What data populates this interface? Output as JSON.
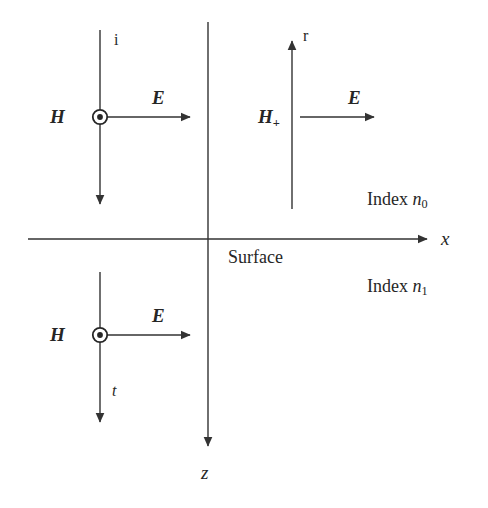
{
  "figure": {
    "name": "reflection-transmission-at-surface-diagram",
    "stroke_color": "#333333",
    "text_color": "#262626",
    "background": "#ffffff"
  },
  "axes": {
    "x_axis": {
      "label": "x",
      "direction": "right",
      "y": 239,
      "x_start": 28,
      "x_end": 433
    },
    "z_axis": {
      "label": "z",
      "direction": "down",
      "x": 208,
      "y_start": 22,
      "y_end": 452
    },
    "origin_label": "Surface"
  },
  "media": {
    "upper": {
      "prefix": "Index ",
      "symbol": "n",
      "subscript": "0"
    },
    "lower": {
      "prefix": "Index ",
      "symbol": "n",
      "subscript": "1"
    }
  },
  "rays": [
    {
      "id": "incident",
      "ray_label": "i",
      "h_label": "H",
      "h_subscript": "",
      "h_symbol": "circle-dot",
      "h_symbol_meaning": "out-of-page",
      "e_label": "E",
      "e_direction": "right",
      "propagation": "down",
      "x": 100,
      "y_start": 30,
      "y_end": 210,
      "h_y": 117,
      "e_x_start": 100,
      "e_x_end": 196,
      "ray_label_x": 114,
      "ray_label_y": 38,
      "e_label_x": 152,
      "e_label_y": 97
    },
    {
      "id": "reflected",
      "ray_label": "r",
      "h_label": "H",
      "h_subscript": "+",
      "h_symbol": "plus-on-line",
      "h_symbol_meaning": "into-page",
      "e_label": "E",
      "e_direction": "right",
      "propagation": "up",
      "x": 292,
      "y_start": 35,
      "y_end": 209,
      "h_y": 117,
      "e_x_start": 300,
      "e_x_end": 380,
      "ray_label_x": 303,
      "ray_label_y": 34,
      "e_label_x": 348,
      "e_label_y": 97
    },
    {
      "id": "transmitted",
      "ray_label": "t",
      "h_label": "H",
      "h_subscript": "",
      "h_symbol": "circle-dot",
      "h_symbol_meaning": "out-of-page",
      "e_label": "E",
      "e_direction": "right",
      "propagation": "down",
      "x": 100,
      "y_start": 272,
      "y_end": 428,
      "h_y": 335,
      "e_x_start": 100,
      "e_x_end": 196,
      "ray_label_x": 112,
      "ray_label_y": 390,
      "e_label_x": 152,
      "e_label_y": 315
    }
  ]
}
